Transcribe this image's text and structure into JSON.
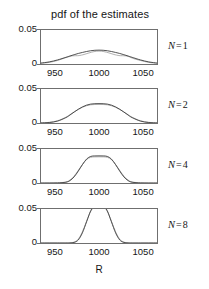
{
  "figure": {
    "title": "pdf of the estimates",
    "xaxis_label": "R"
  },
  "axes": {
    "ytick_top": "0.05",
    "ytick_bottom": "0",
    "xticks": [
      "950",
      "1000",
      "1050"
    ]
  },
  "panels": [
    {
      "n_symbol": "N",
      "n_equals": "=",
      "n_value": "1",
      "label": "N = 1"
    },
    {
      "n_symbol": "N",
      "n_equals": "=",
      "n_value": "2",
      "label": "N = 2"
    },
    {
      "n_symbol": "N",
      "n_equals": "=",
      "n_value": "4",
      "label": "N = 4"
    },
    {
      "n_symbol": "N",
      "n_equals": "=",
      "n_value": "8",
      "label": "N = 8"
    }
  ],
  "colors": {
    "axis": "#6f6f6f",
    "curve_primary": "#3a3a3a",
    "curve_secondary": "#9a9a9a",
    "text": "#161616",
    "background": "#ffffff"
  },
  "chart_data": {
    "type": "line",
    "title": "pdf of the estimates",
    "xlabel": "R",
    "ylabel": "",
    "xlim": [
      930,
      1070
    ],
    "ylim": [
      0,
      0.05
    ],
    "grid": false,
    "legend": "none",
    "xticks": [
      950,
      1000,
      1050
    ],
    "yticks": [
      0,
      0.05
    ],
    "panels": [
      {
        "panel_label": "N = 1",
        "N": 1,
        "series": [
          {
            "name": "theoretical pdf",
            "distribution": "gaussian",
            "mean": 1000,
            "sigma": 19.6,
            "peak": 0.0204,
            "x": [
              930,
              940,
              950,
              960,
              965,
              970,
              975,
              980,
              985,
              990,
              995,
              1000,
              1005,
              1010,
              1015,
              1020,
              1025,
              1030,
              1035,
              1040,
              1050,
              1060,
              1070
            ],
            "y": [
              0.0014,
              0.0031,
              0.006,
              0.0098,
              0.0118,
              0.0137,
              0.0155,
              0.017,
              0.0184,
              0.0195,
              0.0202,
              0.0204,
              0.0202,
              0.0195,
              0.0184,
              0.017,
              0.0155,
              0.0137,
              0.0118,
              0.0098,
              0.006,
              0.0031,
              0.0014
            ]
          },
          {
            "name": "empirical histogram pdf",
            "distribution": "flat-shouldered",
            "mean": 1000,
            "peak": 0.019,
            "x": [
              930,
              940,
              950,
              958,
              964,
              968,
              972,
              976,
              982,
              988,
              994,
              1000,
              1006,
              1012,
              1018,
              1024,
              1028,
              1032,
              1036,
              1042,
              1050,
              1060,
              1070
            ],
            "y": [
              0.001,
              0.0024,
              0.0052,
              0.0086,
              0.0108,
              0.012,
              0.0122,
              0.0124,
              0.014,
              0.0163,
              0.0182,
              0.019,
              0.0182,
              0.0163,
              0.014,
              0.0124,
              0.0122,
              0.012,
              0.0108,
              0.0078,
              0.0052,
              0.0024,
              0.001
            ]
          }
        ]
      },
      {
        "panel_label": "N = 2",
        "N": 2,
        "series": [
          {
            "name": "theoretical pdf",
            "distribution": "gaussian",
            "mean": 1000,
            "sigma": 14.0,
            "peak": 0.0285,
            "x": [
              930,
              940,
              950,
              960,
              965,
              970,
              975,
              980,
              985,
              990,
              995,
              1000,
              1005,
              1010,
              1015,
              1020,
              1025,
              1030,
              1035,
              1040,
              1050,
              1060,
              1070
            ],
            "y": [
              0.0001,
              0.0007,
              0.0028,
              0.0079,
              0.0118,
              0.0161,
              0.0202,
              0.0237,
              0.0263,
              0.0278,
              0.0284,
              0.0285,
              0.0284,
              0.0278,
              0.0263,
              0.0237,
              0.0202,
              0.0161,
              0.0118,
              0.0079,
              0.0028,
              0.0007,
              0.0001
            ]
          },
          {
            "name": "empirical histogram pdf",
            "distribution": "gaussian",
            "mean": 1000,
            "sigma": 14.6,
            "peak": 0.0273,
            "x": [
              930,
              940,
              950,
              960,
              965,
              970,
              975,
              980,
              985,
              990,
              995,
              1000,
              1005,
              1010,
              1015,
              1020,
              1025,
              1030,
              1035,
              1040,
              1050,
              1060,
              1070
            ],
            "y": [
              0.0002,
              0.001,
              0.0033,
              0.0085,
              0.0123,
              0.0163,
              0.02,
              0.0231,
              0.0254,
              0.0268,
              0.0272,
              0.0273,
              0.0272,
              0.0268,
              0.0254,
              0.0231,
              0.02,
              0.0163,
              0.0123,
              0.0085,
              0.0033,
              0.001,
              0.0002
            ]
          }
        ]
      },
      {
        "panel_label": "N = 4",
        "N": 4,
        "series": [
          {
            "name": "theoretical pdf",
            "distribution": "gaussian",
            "mean": 1000,
            "sigma": 10.0,
            "peak": 0.0399,
            "x": [
              930,
              940,
              950,
              960,
              965,
              970,
              975,
              980,
              985,
              990,
              995,
              1000,
              1005,
              1010,
              1015,
              1020,
              1025,
              1030,
              1035,
              1040,
              1050,
              1060,
              1070
            ],
            "y": [
              0.0,
              0.0,
              0.0001,
              0.0011,
              0.0036,
              0.009,
              0.0175,
              0.027,
              0.0352,
              0.0391,
              0.0398,
              0.0399,
              0.0398,
              0.0391,
              0.0352,
              0.027,
              0.0175,
              0.009,
              0.0036,
              0.0011,
              0.0001,
              0.0,
              0.0
            ]
          },
          {
            "name": "empirical histogram pdf",
            "distribution": "gaussian",
            "mean": 1000,
            "sigma": 10.4,
            "peak": 0.0385,
            "x": [
              930,
              940,
              950,
              960,
              965,
              970,
              975,
              980,
              985,
              990,
              995,
              1000,
              1005,
              1010,
              1015,
              1020,
              1025,
              1030,
              1035,
              1040,
              1050,
              1060,
              1070
            ],
            "y": [
              0.0,
              0.0,
              0.0002,
              0.0015,
              0.0044,
              0.0102,
              0.0185,
              0.0273,
              0.0345,
              0.0378,
              0.0384,
              0.0385,
              0.0384,
              0.0378,
              0.0345,
              0.0273,
              0.0185,
              0.0102,
              0.0044,
              0.0015,
              0.0002,
              0.0,
              0.0
            ]
          }
        ]
      },
      {
        "panel_label": "N = 8",
        "N": 8,
        "series": [
          {
            "name": "theoretical pdf",
            "distribution": "gaussian",
            "mean": 1000,
            "sigma": 7.0,
            "peak": 0.057,
            "x": [
              930,
              940,
              950,
              960,
              965,
              970,
              975,
              980,
              985,
              990,
              995,
              1000,
              1005,
              1010,
              1015,
              1020,
              1025,
              1030,
              1035,
              1040,
              1050,
              1060,
              1070
            ],
            "y": [
              0.0,
              0.0,
              0.0,
              0.0,
              0.0001,
              0.0008,
              0.0045,
              0.015,
              0.0312,
              0.0474,
              0.0558,
              0.057,
              0.0558,
              0.0474,
              0.0312,
              0.015,
              0.0045,
              0.0008,
              0.0001,
              0.0,
              0.0,
              0.0,
              0.0
            ]
          },
          {
            "name": "empirical histogram pdf",
            "distribution": "gaussian",
            "mean": 1000,
            "sigma": 7.3,
            "peak": 0.0548,
            "x": [
              930,
              940,
              950,
              960,
              965,
              970,
              975,
              980,
              985,
              990,
              995,
              1000,
              1005,
              1010,
              1015,
              1020,
              1025,
              1030,
              1035,
              1040,
              1050,
              1060,
              1070
            ],
            "y": [
              0.0,
              0.0,
              0.0,
              0.0,
              0.0002,
              0.0013,
              0.0057,
              0.0167,
              0.0319,
              0.0464,
              0.0537,
              0.0548,
              0.0537,
              0.0464,
              0.0319,
              0.0167,
              0.0057,
              0.0013,
              0.0002,
              0.0,
              0.0,
              0.0,
              0.0
            ]
          }
        ]
      }
    ]
  }
}
